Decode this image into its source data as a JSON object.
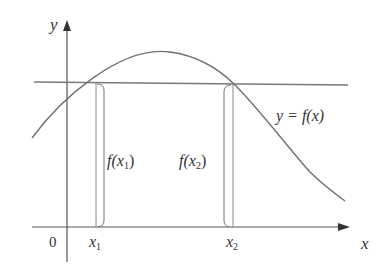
{
  "diagram": {
    "type": "function graph",
    "axes": {
      "x_label": "x",
      "y_label": "y",
      "origin_label": "0"
    },
    "curve_label": "y = f(x)",
    "horizontal_line": "level line intersecting curve at two points",
    "points": [
      {
        "x_label": "x1",
        "sub": "1",
        "value_label": "f(x1)"
      },
      {
        "x_label": "x2",
        "sub": "2",
        "value_label": "f(x2)"
      }
    ],
    "text": {
      "y": "y",
      "x": "x",
      "zero": "0",
      "x1_main": "x",
      "x1_sub": "1",
      "x2_main": "x",
      "x2_sub": "2",
      "curve_eq": "y = f(x)",
      "fx1_pre": "f(x",
      "fx1_sub": "1",
      "fx1_post": ")",
      "fx2_pre": "f(x",
      "fx2_sub": "2",
      "fx2_post": ")"
    },
    "colors": {
      "line": "#707070",
      "text": "#333333"
    }
  }
}
